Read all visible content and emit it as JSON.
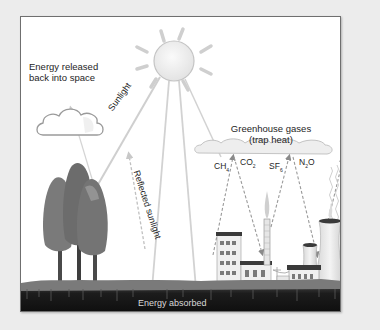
{
  "diagram": {
    "labels": {
      "energy_released_line1": "Energy released",
      "energy_released_line2": "back into space",
      "sunlight": "Sunlight",
      "reflected_sunlight": "Reflected sunlight",
      "greenhouse_gases_line1": "Greenhouse gases",
      "greenhouse_gases_line2": "(trap heat)",
      "energy_absorbed": "Energy absorbed"
    },
    "gases": [
      {
        "base": "CH",
        "sub": "4"
      },
      {
        "base": "CO",
        "sub": "2"
      },
      {
        "base": "SF",
        "sub": "6"
      },
      {
        "base": "N",
        "sub": "2",
        "tail": "O"
      }
    ],
    "elements": [
      "sun",
      "cloud",
      "trees",
      "greenhouse-gas-cloud",
      "factory",
      "smokestack",
      "power-lines",
      "cooling-towers",
      "ground"
    ],
    "colors": {
      "background": "#ececec",
      "panel": "#ffffff",
      "frame": "#6f6f6f",
      "sun_fill": "#f2f2f2",
      "sun_stroke": "#bdbdbd",
      "arrow": "#c8c8c8",
      "dashed_arrow": "#9a9a9a",
      "tree": "#6a6a6a",
      "ground": "#141414",
      "grass": "#7a7a7a",
      "text": "#1e1e1e",
      "absorbed_text": "#d8d8d8"
    }
  }
}
